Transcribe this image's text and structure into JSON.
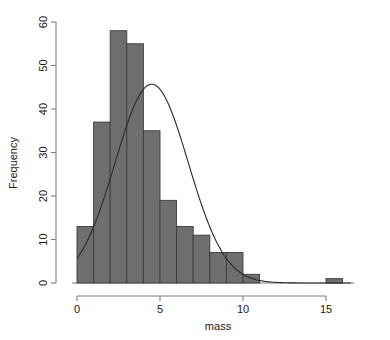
{
  "chart_data": {
    "type": "bar",
    "title": "",
    "xlabel": "mass",
    "ylabel": "Frequency",
    "xlim": [
      -0.35,
      16.8
    ],
    "ylim": [
      0,
      61
    ],
    "xticks": [
      0,
      5,
      10,
      15
    ],
    "xtick_labels": [
      "0",
      "5",
      "10",
      "15"
    ],
    "yticks": [
      0,
      10,
      20,
      30,
      40,
      50,
      60
    ],
    "ytick_labels": [
      "0",
      "10",
      "20",
      "30",
      "40",
      "50",
      "60"
    ],
    "grid": false,
    "legend": "none",
    "bin_width": 1,
    "bin_edges": [
      0,
      1,
      2,
      3,
      4,
      5,
      6,
      7,
      8,
      9,
      10,
      11,
      12,
      13,
      14,
      15,
      16
    ],
    "categories": [
      "0-1",
      "1-2",
      "2-3",
      "3-4",
      "4-5",
      "5-6",
      "6-7",
      "7-8",
      "8-9",
      "9-10",
      "10-11",
      "11-12",
      "12-13",
      "13-14",
      "14-15",
      "15-16"
    ],
    "values": [
      13,
      37,
      58,
      55,
      35,
      19,
      13,
      11,
      7,
      7,
      2,
      0,
      0,
      0,
      0,
      1
    ],
    "series": [
      {
        "name": "Frequency",
        "type": "bar",
        "values": [
          13,
          37,
          58,
          55,
          35,
          19,
          13,
          11,
          7,
          7,
          2,
          0,
          0,
          0,
          0,
          1
        ]
      },
      {
        "name": "Normal density curve",
        "type": "line",
        "peak_x": 4.5,
        "peak_y": 45.7,
        "mean": 4.5,
        "sd": 2.2,
        "area_scale": 252,
        "x_start": 0.0,
        "x_end": 16.5
      }
    ],
    "colors": {
      "bar_fill": "#6e6e6e",
      "bar_border": "#3c3c3c",
      "curve": "#2b2b2b",
      "axis": "#808080",
      "text": "#1a1a1a",
      "background": "#ffffff"
    }
  }
}
